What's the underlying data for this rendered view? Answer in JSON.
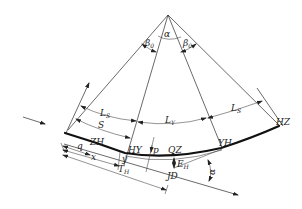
{
  "diagram": {
    "title": "",
    "type": "transition-curve-geometry",
    "colors": {
      "background": "#ffffff",
      "line": "#2a2a2a",
      "curve": "#111111"
    },
    "labels": {
      "alpha_top": "α",
      "beta_left": "β",
      "beta_left_sub": "0",
      "beta_right": "β",
      "beta_right_sub": "0",
      "ls_left": "L",
      "ls_left_sub": "S",
      "ly": "L",
      "ly_sub": "Y",
      "ls_right": "L",
      "ls_right_sub": "S",
      "s": "S",
      "zh": "ZH",
      "hy": "HY",
      "p": "p",
      "qz": "QZ",
      "yh": "YH",
      "hz": "HZ",
      "q": "q",
      "x": "x",
      "y": "y",
      "th": "T",
      "th_sub": "H",
      "eh": "E",
      "eh_sub": "H",
      "jd": "JD",
      "alpha_right": "α"
    },
    "points": [
      {
        "name": "ZH",
        "x": 65,
        "y": 133
      },
      {
        "name": "HY",
        "x": 125,
        "y": 153
      },
      {
        "name": "QZ",
        "x": 170,
        "y": 157
      },
      {
        "name": "YH",
        "x": 221,
        "y": 148
      },
      {
        "name": "HZ",
        "x": 278,
        "y": 127
      },
      {
        "name": "JD",
        "x": 174,
        "y": 168
      },
      {
        "name": "center",
        "x": 168,
        "y": 15
      }
    ]
  }
}
